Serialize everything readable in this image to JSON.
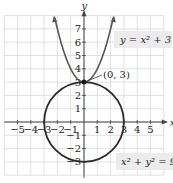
{
  "chart_data": {
    "type": "line",
    "title": "",
    "xlabel": "x",
    "ylabel": "y",
    "xlim": [
      -6,
      6
    ],
    "ylim": [
      -4,
      8
    ],
    "grid": true,
    "x_ticks": [
      -5,
      -4,
      -3,
      -2,
      -1,
      1,
      2,
      3,
      4,
      5
    ],
    "y_ticks": [
      -3,
      -2,
      -1,
      1,
      2,
      3,
      4,
      5,
      6,
      7
    ],
    "series": [
      {
        "name": "y = x^2 + 3",
        "kind": "parabola",
        "equation": "y = x² + 3",
        "points": [
          [
            -2.2,
            7.84
          ],
          [
            -2,
            7
          ],
          [
            -1.5,
            5.25
          ],
          [
            -1,
            4
          ],
          [
            -0.5,
            3.25
          ],
          [
            0,
            3
          ],
          [
            0.5,
            3.25
          ],
          [
            1,
            4
          ],
          [
            1.5,
            5.25
          ],
          [
            2,
            7
          ],
          [
            2.2,
            7.84
          ]
        ]
      },
      {
        "name": "x^2 + y^2 = 9",
        "kind": "circle",
        "equation": "x² + y² = 9",
        "center": [
          0,
          0
        ],
        "radius": 3
      }
    ],
    "annotations": [
      {
        "text": "(0, 3)",
        "point": [
          0,
          3
        ]
      }
    ]
  },
  "labels": {
    "x_axis": "x",
    "y_axis": "y",
    "parabola_eq": "y = x² + 3",
    "circle_eq": "x² + y² = 9",
    "intersection": "(0, 3)"
  },
  "colors": {
    "curve": "#2b2b2b",
    "grid": "#d9d9d9",
    "axis": "#444444",
    "label_box": "#ececec"
  }
}
